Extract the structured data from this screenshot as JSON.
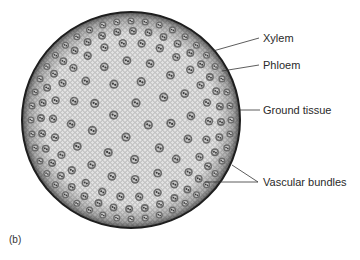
{
  "figure": {
    "panel_label": "(b)",
    "labels": [
      {
        "id": "xylem",
        "text": "Xylem"
      },
      {
        "id": "phloem",
        "text": "Phloem"
      },
      {
        "id": "ground",
        "text": "Ground tissue"
      },
      {
        "id": "vascular",
        "text": "Vascular bundles"
      }
    ],
    "colors": {
      "background": "#ffffff",
      "tissue_fill": "#d9d9d9",
      "edge": "#1e1e1e",
      "bundle": "#4a4a4a",
      "leader": "#333333"
    }
  }
}
